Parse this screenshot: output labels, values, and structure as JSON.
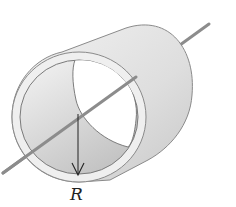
{
  "figure": {
    "radius_label": "R"
  },
  "colors": {
    "background": "#ffffff",
    "cylinder_light": "#ececec",
    "cylinder_mid": "#d6d6d6",
    "cylinder_dark": "#bdbdbd",
    "rim": "#efefef",
    "outline": "#8a8a8a",
    "axis": "#8c8c8c",
    "arrow": "#222222"
  }
}
